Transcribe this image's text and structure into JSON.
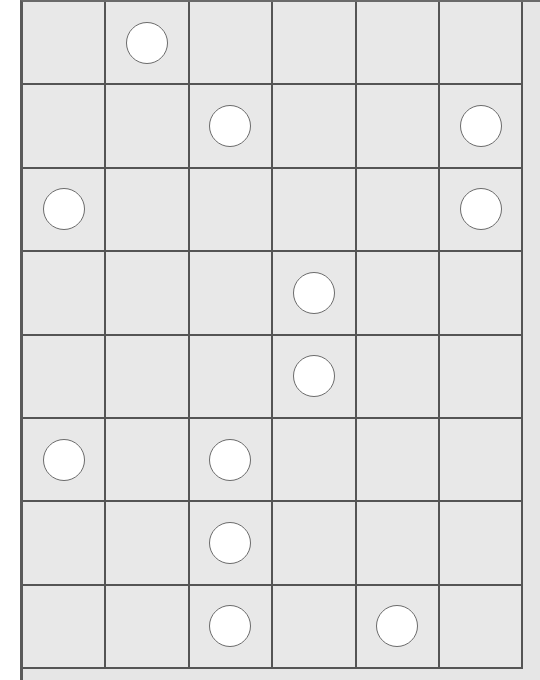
{
  "board": {
    "rows": 8,
    "cols": 6,
    "cell_size": 83.4,
    "colors": {
      "cell": "#e8e8e8",
      "grid_line": "#555555",
      "piece_fill": "#ffffff",
      "piece_stroke": "#6b6b6b"
    },
    "pieces": [
      {
        "row": 0,
        "col": 1
      },
      {
        "row": 1,
        "col": 2
      },
      {
        "row": 1,
        "col": 5
      },
      {
        "row": 2,
        "col": 0
      },
      {
        "row": 2,
        "col": 5
      },
      {
        "row": 3,
        "col": 3
      },
      {
        "row": 4,
        "col": 3
      },
      {
        "row": 5,
        "col": 0
      },
      {
        "row": 5,
        "col": 2
      },
      {
        "row": 6,
        "col": 2
      },
      {
        "row": 7,
        "col": 2
      },
      {
        "row": 7,
        "col": 4
      }
    ]
  }
}
